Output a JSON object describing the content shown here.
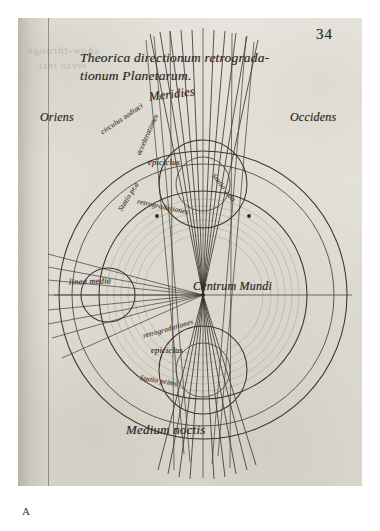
{
  "document": {
    "folio_number": "34",
    "title_line_1": "Theorica directionum retrograda-",
    "title_line_2": "tionum Planetarum.",
    "caption_letter": "A",
    "bleed_through_line_1": "show-through",
    "bleed_through_line_2": "verso text"
  },
  "diagram": {
    "cardinal_points": {
      "east": "Oriens",
      "west": "Occidens",
      "south": "Meridies",
      "north": "Medium noctis"
    },
    "center_label": "Centrum Mundi",
    "zodiac_circle_label": "circulus zodiaci",
    "mean_line_label": "linea media",
    "epicycle_upper_label": "epiciclus",
    "epicycle_lower_label": "epiciclus",
    "acceleration_label": "accelerationes",
    "retrogradation_upper_label": "retrogradationes",
    "retrogradation_lower_label": "retrogradationes",
    "station_first_upper": "Statio pr.a",
    "station_second_upper": "Statio 2.da",
    "station_first_lower": "Statio prima"
  },
  "geometry": {
    "center_x": 185,
    "center_y": 277,
    "outer_radius": 144,
    "second_radius": 131,
    "deferent_radius": 104,
    "faint_rings": [
      96,
      89,
      82,
      75,
      68
    ],
    "epicycle_upper": {
      "cx": 185,
      "cy": 166,
      "r_outer": 44,
      "r_inner": 27
    },
    "epicycle_lower": {
      "cx": 185,
      "cy": 352,
      "r_outer": 44,
      "r_inner": 27
    },
    "mean_line_circle": {
      "cx": 90,
      "cy": 277,
      "r": 27
    }
  },
  "colors": {
    "ink": "#2f2a24",
    "paper": "#e4e1d9",
    "line": "#3b352d",
    "faint_line": "#9a9488"
  }
}
